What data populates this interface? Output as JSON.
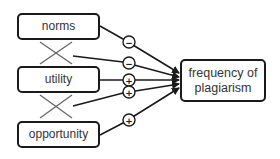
{
  "diagram": {
    "nodes": {
      "norms": "norms",
      "utility": "utility",
      "opportunity": "opportunity",
      "target": "frequency of plagiarism"
    },
    "edges": [
      {
        "from": "norms",
        "to": "frequency of plagiarism",
        "sign": "−"
      },
      {
        "from": "norms × utility (interaction)",
        "to": "frequency of plagiarism",
        "sign": "−"
      },
      {
        "from": "utility",
        "to": "frequency of plagiarism",
        "sign": "+"
      },
      {
        "from": "utility × opportunity (interaction)",
        "to": "frequency of plagiarism",
        "sign": "+"
      },
      {
        "from": "opportunity",
        "to": "frequency of plagiarism",
        "sign": "+"
      }
    ],
    "signs": {
      "norms": "−",
      "norms_utility": "−",
      "utility": "+",
      "utility_opportunity": "+",
      "opportunity": "+"
    }
  }
}
